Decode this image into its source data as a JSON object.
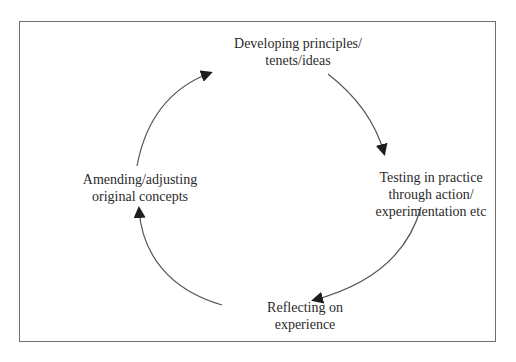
{
  "diagram": {
    "type": "cycle",
    "direction": "clockwise",
    "nodes": [
      {
        "id": "top",
        "lines": [
          "Developing principles/",
          "tenets/ideas"
        ]
      },
      {
        "id": "right",
        "lines": [
          "Testing in practice",
          "through action/",
          "experimentation etc"
        ]
      },
      {
        "id": "bottom",
        "lines": [
          "Reflecting on",
          "experience"
        ]
      },
      {
        "id": "left",
        "lines": [
          "Amending/adjusting",
          "original concepts"
        ]
      }
    ],
    "edges": [
      {
        "from": "top",
        "to": "right"
      },
      {
        "from": "right",
        "to": "bottom"
      },
      {
        "from": "bottom",
        "to": "left"
      },
      {
        "from": "left",
        "to": "top"
      }
    ],
    "colors": {
      "line": "#555555",
      "arrowhead": "#1e1e1e",
      "frame": "#6e6e6e",
      "text": "#2b2b2b"
    }
  }
}
